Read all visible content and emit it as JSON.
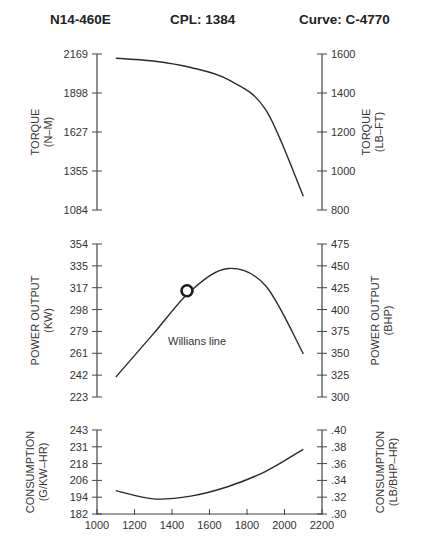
{
  "header": {
    "model": "N14-460E",
    "cpl": "CPL:  1384",
    "curve": "Curve: C-4770"
  },
  "chart_data": [
    {
      "type": "line",
      "title": "Torque",
      "x": [
        1100,
        1300,
        1500,
        1700,
        1900,
        2100
      ],
      "series": [
        {
          "name": "Torque (N-M)",
          "values": [
            2140,
            2120,
            2075,
            1990,
            1780,
            1180
          ]
        }
      ],
      "xlabel": "",
      "ylabel": "TORQUE (N-M)",
      "ylabel_right": "TORQUE (LB-FT)",
      "yticks_left": [
        "2169",
        "1898",
        "1627",
        "1355",
        "1084"
      ],
      "yticks_right": [
        "1600",
        "1400",
        "1200",
        "1000",
        "800"
      ],
      "ylim": [
        1084,
        2169
      ],
      "ylim_right": [
        800,
        1600
      ],
      "grid": false
    },
    {
      "type": "line",
      "title": "Power Output",
      "x": [
        1100,
        1300,
        1500,
        1700,
        1900,
        2100
      ],
      "series": [
        {
          "name": "Power (KW)",
          "values": [
            240,
            277,
            314,
            333,
            318,
            260
          ]
        }
      ],
      "ylabel": "POWER OUTPUT (KW)",
      "ylabel_right": "POWER OUTPUT (BHP)",
      "yticks_left": [
        "354",
        "335",
        "317",
        "298",
        "279",
        "261",
        "242",
        "223"
      ],
      "yticks_right": [
        "475",
        "450",
        "425",
        "400",
        "375",
        "350",
        "325",
        "300"
      ],
      "ylim": [
        223,
        354
      ],
      "ylim_right": [
        300,
        475
      ],
      "annotations": [
        {
          "text": "Willians line",
          "type": "label"
        },
        {
          "type": "circle-marker",
          "x": 1480,
          "y": 314
        }
      ],
      "grid": false
    },
    {
      "type": "line",
      "title": "Consumption",
      "x": [
        1100,
        1300,
        1500,
        1700,
        1900,
        2100
      ],
      "series": [
        {
          "name": "Consumption (G/KW-HR)",
          "values": [
            199,
            193,
            195,
            202,
            213,
            229
          ]
        }
      ],
      "xlabel": "",
      "xticks": [
        "1000",
        "1200",
        "1400",
        "1600",
        "1800",
        "2000",
        "2200"
      ],
      "xlim": [
        1000,
        2200
      ],
      "ylabel": "CONSUMPTION (G/KW-HR)",
      "ylabel_right": "CONSUMPTION (LB/BHP-HR)",
      "yticks_left": [
        "243",
        "231",
        "218",
        "206",
        "194",
        "182"
      ],
      "yticks_right": [
        ".40",
        ".38",
        ".36",
        ".34",
        ".32",
        ".30"
      ],
      "ylim": [
        182,
        243
      ],
      "ylim_right": [
        0.3,
        0.4
      ],
      "grid": false
    }
  ],
  "labels": {
    "torque_left_1": "TORQUE",
    "torque_left_2": "(N–M)",
    "torque_right_1": "TORQUE",
    "torque_right_2": "(LB–FT)",
    "power_left_1": "POWER OUTPUT",
    "power_left_2": "(KW)",
    "power_right_1": "POWER OUTPUT",
    "power_right_2": "(BHP)",
    "cons_left_1": "CONSUMPTION",
    "cons_left_2": "(G/KW–HR)",
    "cons_right_1": "CONSUMPTION",
    "cons_right_2": "(LB/BHP–HR)",
    "willians": "Willians line"
  },
  "colors": {
    "axis": "#444444",
    "curve": "#2a2a2a",
    "text": "#333333"
  }
}
